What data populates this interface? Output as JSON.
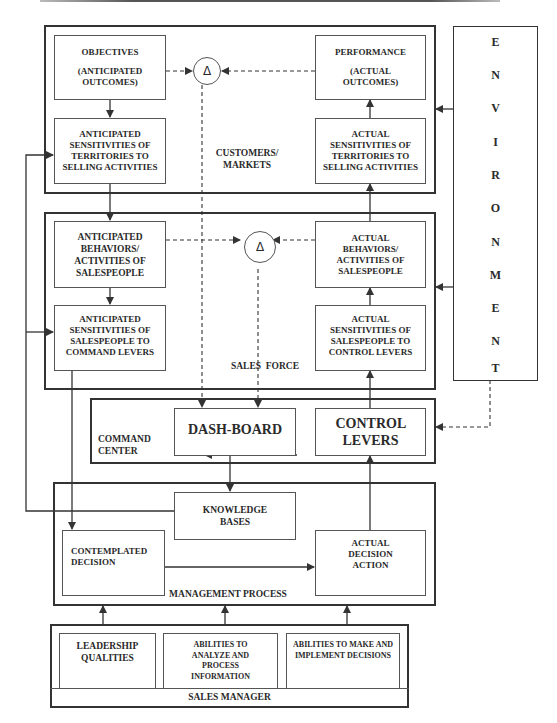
{
  "diagram": {
    "customers_markets": {
      "label": "CUSTOMERS/ MARKETS",
      "objectives": {
        "title": "OBJECTIVES",
        "subtitle": "(ANTICIPATED OUTCOMES)"
      },
      "anticipated_sensitivities_territories": "ANTICIPATED SENSITIVITIES OF TERRITORIES TO SELLING ACTIVITIES",
      "performance": {
        "title": "PERFORMANCE",
        "subtitle": "(ACTUAL OUTCOMES)"
      },
      "actual_sensitivities_territories": "ACTUAL SENSITIVITIES OF TERRITORIES TO SELLING ACTIVITIES",
      "delta_symbol": "Δ"
    },
    "sales_force": {
      "label": "SALES  FORCE",
      "anticipated_behaviors": "ANTICIPATED BEHAVIORS/ ACTIVITIES OF SALESPEOPLE",
      "anticipated_sensitivities_salespeople": "ANTICIPATED SENSITIVITIES OF SALESPEOPLE TO COMMAND LEVERS",
      "actual_behaviors": "ACTUAL BEHAVIORS/ ACTIVITIES OF SALESPEOPLE",
      "actual_sensitivities_salespeople": "ACTUAL SENSITIVITIES OF SALESPEOPLE TO CONTROL LEVERS",
      "delta_symbol": "Δ"
    },
    "environment": {
      "letters": [
        "E",
        "N",
        "V",
        "I",
        "R",
        "O",
        "N",
        "M",
        "E",
        "N",
        "T"
      ]
    },
    "command_center": {
      "label": "COMMAND CENTER",
      "dashboard": "DASH-BOARD",
      "control_levers": "CONTROL LEVERS"
    },
    "management_process": {
      "label": "MANAGEMENT PROCESS",
      "knowledge_bases": "KNOWLEDGE BASES",
      "contemplated_decision": "CONTEMPLATED DECISION",
      "actual_decision_action": "ACTUAL DECISION ACTION"
    },
    "sales_manager": {
      "label": "SALES MANAGER",
      "leadership_qualities": "LEADERSHIP QUALITIES",
      "abilities_analyze": "ABILITIES TO ANALYZE AND PROCESS INFORMATION",
      "abilities_make": "ABILITIES TO MAKE AND IMPLEMENT DECISIONS"
    }
  }
}
